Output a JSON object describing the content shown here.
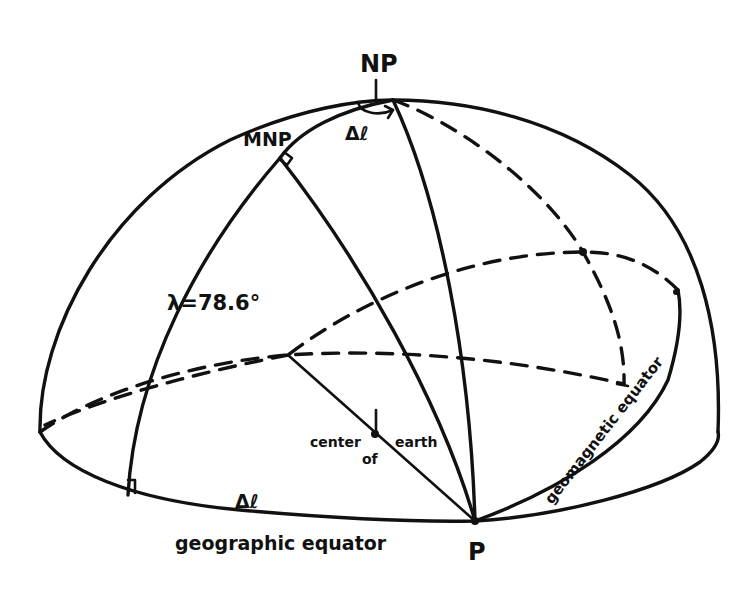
{
  "diagram": {
    "colors": {
      "ink": "#111111",
      "background": "#ffffff"
    },
    "labels": {
      "north_pole": "NP",
      "magnetic_north_pole": "MNP",
      "delta_l_top": "Δℓ",
      "delta_l_bottom": "Δℓ",
      "latitude": "λ=78.6°",
      "center_word_1": "center",
      "center_word_2": "of",
      "center_word_3": "earth",
      "geographic_equator": "geographic equator",
      "geomagnetic_equator": "geomagnetic equator",
      "point_p": "P"
    }
  }
}
